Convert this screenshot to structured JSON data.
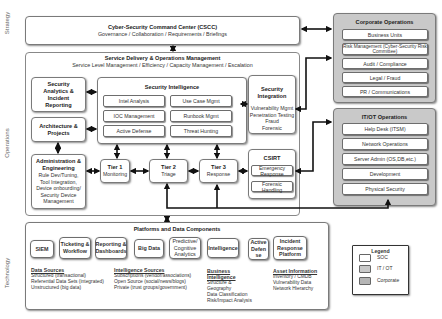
{
  "side_labels": {
    "strategy": "Strategy",
    "operations": "Operations",
    "technology": "Technology"
  },
  "cscc": {
    "title": "Cyber-Security Command Center (CSCC)",
    "subtitle": "Governance / Collaboration / Requirements / Briefings"
  },
  "sdom": {
    "title": "Service Delivery & Operations Management",
    "subtitle": "Service Level Management / Efficiency / Capacity Management / Escalation"
  },
  "left_boxes": {
    "security_analytics": "Security Analytics & Incident Reporting",
    "architecture": "Architecture & Projects",
    "admin_title": "Administration & Engineering",
    "admin_body": "Rule Dev/Tuning, Tool Integration, Device onbourding/ Security Device Management"
  },
  "security_intelligence": {
    "title": "Security Intelligence",
    "items": [
      "Intel Analysis",
      "Use Case Mgmt",
      "IOC Management",
      "Runbook Mgmt",
      "Active Defense",
      "Threat Hunting"
    ]
  },
  "security_integration": {
    "title": "Security Integration",
    "items": [
      "Vulnerability Mgmt",
      "Penetration Testing",
      "Fraud",
      "Forensic"
    ]
  },
  "tiers": [
    {
      "title": "Tier 1",
      "sub": "Monitoring"
    },
    {
      "title": "Tier 2",
      "sub": "Triage"
    },
    {
      "title": "Tier 3",
      "sub": "Response"
    }
  ],
  "csirt": {
    "title": "CSIRT",
    "items": [
      "Emergency Response",
      "Forensic Handling"
    ]
  },
  "corporate_operations": {
    "title": "Corporate Operations",
    "items": [
      "Business Units",
      "Risk Management (Cyber-Security Risk Committee)",
      "Audit / Compliance",
      "Legal / Fraud",
      "PR / Communications"
    ]
  },
  "it_ot_operations": {
    "title": "IT/OT Operations",
    "items": [
      "Help Desk (ITSM)",
      "Network Operations",
      "Server Admin (OS,DB,etc.)",
      "Development",
      "Physical Security"
    ]
  },
  "platforms": {
    "title": "Platforms and Data Components",
    "components": [
      "SIEM",
      "Ticketing & Workflow",
      "Reporting & Dashboards",
      "Big Data",
      "Predictive/ Cognitive Analytics",
      "Intelligence",
      "Active Defen se",
      "Incident Response Platform"
    ],
    "info": [
      {
        "heading": "Data Sources",
        "lines": [
          "Structured (transactional)",
          "Referential Data Sets (integrated)",
          "Unstructured (big data)"
        ]
      },
      {
        "heading": "Intelligence Sources",
        "lines": [
          "Subscriptions (vendor/associations)",
          "Open Source (social/news/blogs)",
          "Private (trust groups/government)"
        ]
      },
      {
        "heading": "Business Intelligence",
        "lines": [
          "Structure & Geography",
          "Data Classification",
          "Risk/Impact Analysis"
        ]
      },
      {
        "heading": "Asset Information",
        "lines": [
          "Inventory / CMDB",
          "Vulnerability Data",
          "Network Hierarchy"
        ]
      }
    ]
  },
  "legend": {
    "title": "Legend",
    "items": [
      {
        "label": "SOC",
        "color": "#ffffff"
      },
      {
        "label": "IT / OT",
        "color": "#c9c9c9"
      },
      {
        "label": "Corporate",
        "color": "#b5b5b5"
      }
    ]
  },
  "colors": {
    "soc": "#ffffff",
    "it_ot": "#c9c9c9",
    "corporate": "#c4c4c4",
    "arrow": "#111111"
  }
}
